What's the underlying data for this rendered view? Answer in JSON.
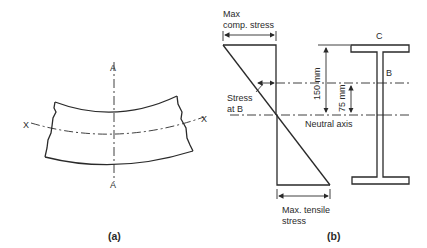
{
  "figure_a": {
    "caption": "(a)",
    "axis_top_label": "A",
    "axis_bottom_label": "A",
    "axis_left_label": "X",
    "axis_right_label": "X"
  },
  "figure_b": {
    "caption": "(b)",
    "max_comp_stress_line1": "Max",
    "max_comp_stress_line2": "comp. stress",
    "stress_at_b_line1": "Stress",
    "stress_at_b_line2": "at B",
    "neutral_axis": "Neutral axis",
    "max_tensile_line1": "Max. tensile",
    "max_tensile_line2": "stress",
    "dim_150": "150 mm",
    "dim_75": "75 mm",
    "point_c": "C",
    "point_b": "B"
  },
  "colors": {
    "line": "#2a2a2a",
    "background": "#ffffff"
  }
}
